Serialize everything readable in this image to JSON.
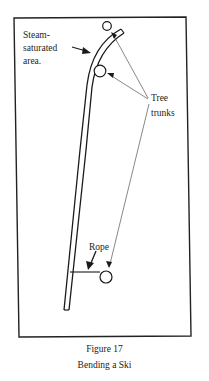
{
  "figure": {
    "labels": {
      "steam": [
        "Steam-",
        "saturated",
        "area."
      ],
      "tree": [
        "Tree",
        "trunks"
      ],
      "rope": "Rope"
    },
    "caption": {
      "number": "Figure 17",
      "title": "Bending a Ski"
    }
  }
}
